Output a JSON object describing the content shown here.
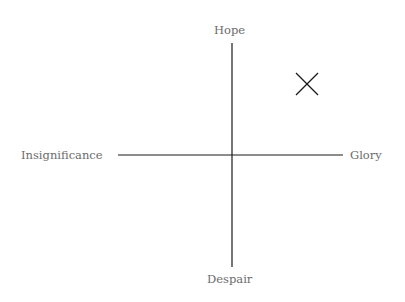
{
  "diagram": {
    "type": "quadrant",
    "axes": {
      "top": "Hope",
      "bottom": "Despair",
      "left": "Insignificance",
      "right": "Glory"
    },
    "marker": {
      "symbol": "X",
      "quadrant": "top-right"
    },
    "colors": {
      "axis": "#1a1a1a",
      "label": "#6b6b6b",
      "background": "#ffffff"
    }
  }
}
